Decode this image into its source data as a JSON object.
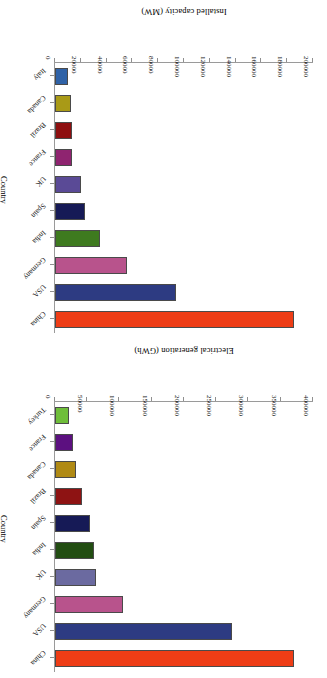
{
  "figure": {
    "panels": [
      "capacity",
      "generation"
    ],
    "orientation": "rotated-180",
    "background": "#ffffff"
  },
  "capacity": {
    "value_axis_title": "Installed capacity (MW)",
    "category_axis_title": "Country",
    "tick_labels": [
      "0",
      "20000",
      "40000",
      "60000",
      "80000",
      "100000",
      "120000",
      "140000",
      "160000",
      "180000",
      "200000"
    ]
  },
  "generation": {
    "value_axis_title": "Electrical generation (GWh)",
    "category_axis_title": "Country",
    "tick_labels": [
      "0",
      "50000",
      "100000",
      "150000",
      "200000",
      "250000",
      "300000",
      "350000",
      "400000"
    ]
  },
  "chart_data": [
    {
      "type": "bar",
      "id": "capacity",
      "orientation": "horizontal",
      "title": "",
      "xlabel": "Installed capacity (MW)",
      "ylabel": "Country",
      "xlim": [
        0,
        200000
      ],
      "xticks": [
        0,
        20000,
        40000,
        60000,
        80000,
        100000,
        120000,
        140000,
        160000,
        180000,
        200000
      ],
      "grid": false,
      "legend": "none",
      "categories": [
        "China",
        "USA",
        "Germany",
        "India",
        "Spain",
        "UK",
        "France",
        "Brazil",
        "Canada",
        "Italy"
      ],
      "values": [
        185000,
        94000,
        56000,
        35000,
        23500,
        20500,
        13500,
        12800,
        12300,
        9800
      ],
      "colors": [
        "#ee3d16",
        "#2d3b82",
        "#b8538c",
        "#3e7a1f",
        "#161a56",
        "#5a4a96",
        "#8f2470",
        "#8e0f10",
        "#a99a17",
        "#2f62a7"
      ]
    },
    {
      "type": "bar",
      "id": "generation",
      "orientation": "horizontal",
      "title": "",
      "xlabel": "Electrical generation (GWh)",
      "ylabel": "Country",
      "xlim": [
        0,
        400000
      ],
      "xticks": [
        0,
        50000,
        100000,
        150000,
        200000,
        250000,
        300000,
        350000,
        400000
      ],
      "grid": false,
      "legend": "none",
      "categories": [
        "China",
        "USA",
        "Germany",
        "UK",
        "India",
        "Spain",
        "Brazil",
        "Canada",
        "France",
        "Turkey"
      ],
      "values": [
        370000,
        275000,
        106000,
        64000,
        60000,
        55000,
        42000,
        33000,
        28000,
        22000
      ],
      "colors": [
        "#ee3d16",
        "#2d3b82",
        "#b8538c",
        "#6b6aa0",
        "#224d12",
        "#161a56",
        "#8e1313",
        "#b08a14",
        "#5c1080",
        "#6fbe3a"
      ]
    }
  ]
}
